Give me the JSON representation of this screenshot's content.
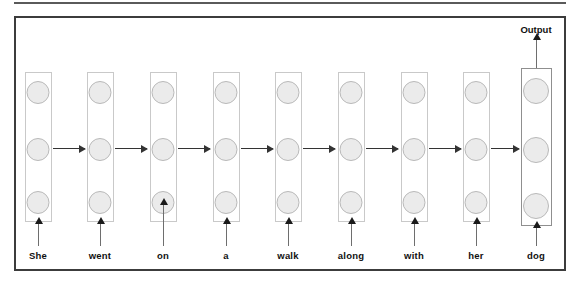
{
  "figure": {
    "type": "unrolled-recurrent-network",
    "node_rows": 3,
    "timestep_count": 9,
    "colors": {
      "frame_border": "#3c3c3c",
      "top_rule": "#5a5a5a",
      "column_border": "#c9c9c9",
      "output_column_border": "#8f8f8f",
      "node_fill": "#ebebeb",
      "node_border": "#b9b9b9",
      "arrow": "#333333",
      "input_arrow": "#6e6e6e",
      "text": "#111111",
      "background": "#ffffff"
    }
  },
  "output": {
    "label": "Output"
  },
  "timesteps": [
    {
      "word": "She",
      "x": 38,
      "input_arrow_top": 224,
      "input_arrow_height": 22,
      "is_output": false
    },
    {
      "word": "went",
      "x": 100,
      "input_arrow_top": 224,
      "input_arrow_height": 22,
      "is_output": false
    },
    {
      "word": "on",
      "x": 163,
      "input_arrow_top": 205,
      "input_arrow_height": 41,
      "is_output": false
    },
    {
      "word": "a",
      "x": 226,
      "input_arrow_top": 224,
      "input_arrow_height": 22,
      "is_output": false
    },
    {
      "word": "walk",
      "x": 288,
      "input_arrow_top": 224,
      "input_arrow_height": 22,
      "is_output": false
    },
    {
      "word": "along",
      "x": 351,
      "input_arrow_top": 224,
      "input_arrow_height": 22,
      "is_output": false
    },
    {
      "word": "with",
      "x": 414,
      "input_arrow_top": 224,
      "input_arrow_height": 22,
      "is_output": false
    },
    {
      "word": "her",
      "x": 476,
      "input_arrow_top": 224,
      "input_arrow_height": 22,
      "is_output": false
    },
    {
      "word": "dog",
      "x": 536,
      "input_arrow_top": 228,
      "input_arrow_height": 18,
      "is_output": true
    }
  ],
  "recurrent_arrows": [
    {
      "left": 53,
      "width": 32
    },
    {
      "left": 115,
      "width": 32
    },
    {
      "left": 178,
      "width": 32
    },
    {
      "left": 241,
      "width": 32
    },
    {
      "left": 303,
      "width": 32
    },
    {
      "left": 366,
      "width": 32
    },
    {
      "left": 429,
      "width": 32
    },
    {
      "left": 491,
      "width": 28
    }
  ]
}
